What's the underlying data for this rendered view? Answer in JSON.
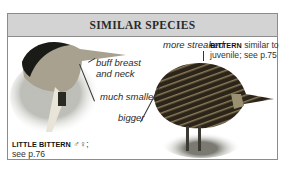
{
  "header": {
    "title": "SIMILAR SPECIES"
  },
  "birds": [
    {
      "name": "LITTLE BITTERN",
      "sex_symbols": "♂♀;",
      "ref": "see p.76"
    },
    {
      "name": "BITTERN",
      "note": "similar to",
      "note2": "juvenile; see p.75"
    }
  ],
  "annotations": {
    "buff1": "buff breast",
    "buff2": "and neck",
    "smaller": "much smaller",
    "streaked": "more streaked",
    "bigger": "bigger"
  },
  "colors": {
    "header_bg": "#d3d3d3",
    "border": "#8c8c8c"
  }
}
